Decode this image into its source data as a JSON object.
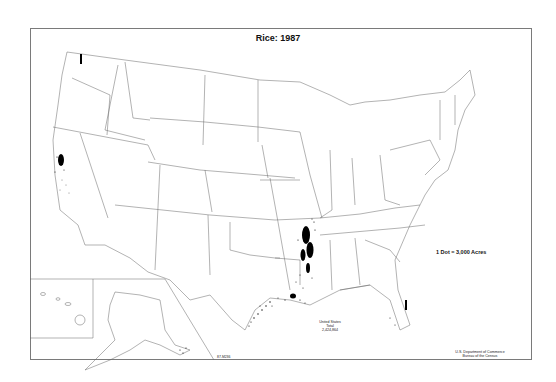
{
  "title": "Rice: 1987",
  "legend": {
    "label": "1 Dot = 3,000 Acres"
  },
  "total": {
    "line1": "United States",
    "line2": "Total",
    "value": "2,424,864"
  },
  "credit": {
    "line1": "U.S. Department of Commerce",
    "line2": "Bureau of the Census"
  },
  "map_code": "87-M236",
  "colors": {
    "border": "#7a7a7a",
    "dots": "#000000",
    "background": "#ffffff"
  },
  "inset": {
    "regions": [
      "Alaska",
      "Hawaii"
    ]
  },
  "concentrations": [
    "Sacramento Valley, CA",
    "Arkansas / Mississippi Delta",
    "Louisiana Gulf Coast",
    "Texas Gulf Coast",
    "Southern Florida",
    "Missouri Bootheel"
  ]
}
